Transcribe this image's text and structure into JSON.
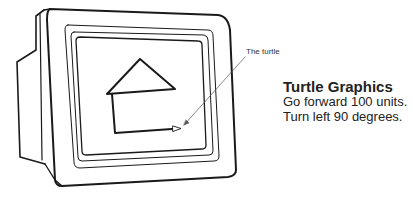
{
  "diagram": {
    "callout_label": "The turtle",
    "caption": {
      "title": "Turtle Graphics",
      "lines": [
        "Go forward 100 units.",
        "Turn left 90 degrees."
      ]
    },
    "colors": {
      "line": "#1a1a1a",
      "text": "#222222",
      "background": "#ffffff"
    }
  }
}
